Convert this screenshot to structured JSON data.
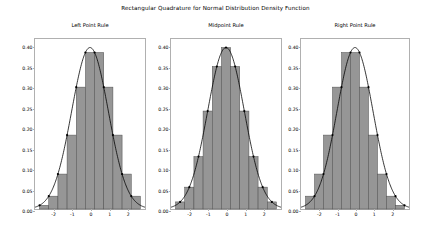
{
  "figure": {
    "suptitle": "Rectangular Quadrature for Normal Distribution Density Function",
    "width": 431,
    "height": 229,
    "background": "#ffffff"
  },
  "style": {
    "bar_fill": "#969696",
    "bar_edge": "#4d4d4d",
    "curve_color": "#000000",
    "marker_color": "#000000",
    "axes_edge": "#b0b0b0",
    "text_color": "#000000"
  },
  "chart_data": [
    {
      "type": "bar",
      "title": "Left Point Rule",
      "xlabel": "",
      "ylabel": "",
      "xlim": [
        -3.0,
        3.0
      ],
      "ylim": [
        0.0,
        0.42
      ],
      "grid": false,
      "legend": null,
      "xticks": [
        -2,
        -1,
        0,
        1,
        2
      ],
      "xticklabels": [
        "-2",
        "-1",
        "0",
        "1",
        "2"
      ],
      "yticks": [
        0.0,
        0.05,
        0.1,
        0.15,
        0.2,
        0.25,
        0.3,
        0.35,
        0.4
      ],
      "yticklabels": [
        "0.00",
        "0.05",
        "0.10",
        "0.15",
        "0.20",
        "0.25",
        "0.30",
        "0.35",
        "0.40"
      ],
      "bin_width": 0.5,
      "bin_left_edges": [
        -2.75,
        -2.25,
        -1.75,
        -1.25,
        -0.75,
        -0.25,
        0.25,
        0.75,
        1.25,
        1.75,
        2.25
      ],
      "sample_points": [
        -2.75,
        -2.25,
        -1.75,
        -1.25,
        -0.75,
        -0.25,
        0.25,
        0.75,
        1.25,
        1.75,
        2.25
      ],
      "values": [
        0.0091,
        0.0317,
        0.0863,
        0.1826,
        0.3011,
        0.3867,
        0.3867,
        0.3011,
        0.1826,
        0.0863,
        0.0317
      ],
      "curve": {
        "name": "Normal density",
        "mean": 0.0,
        "std": 1.0,
        "peak": 0.3989
      }
    },
    {
      "type": "bar",
      "title": "Midpoint Rule",
      "xlabel": "",
      "ylabel": "",
      "xlim": [
        -3.0,
        3.0
      ],
      "ylim": [
        0.0,
        0.42
      ],
      "grid": false,
      "legend": null,
      "xticks": [
        -2,
        -1,
        0,
        1,
        2
      ],
      "xticklabels": [
        "-2",
        "-1",
        "0",
        "1",
        "2"
      ],
      "yticks": [
        0.0,
        0.05,
        0.1,
        0.15,
        0.2,
        0.25,
        0.3,
        0.35,
        0.4
      ],
      "yticklabels": [
        "0.00",
        "0.05",
        "0.10",
        "0.15",
        "0.20",
        "0.25",
        "0.30",
        "0.35",
        "0.40"
      ],
      "bin_width": 0.5,
      "bin_left_edges": [
        -2.75,
        -2.25,
        -1.75,
        -1.25,
        -0.75,
        -0.25,
        0.25,
        0.75,
        1.25,
        1.75,
        2.25
      ],
      "sample_points": [
        -2.5,
        -2.0,
        -1.5,
        -1.0,
        -0.5,
        0.0,
        0.5,
        1.0,
        1.5,
        2.0,
        2.5
      ],
      "values": [
        0.0175,
        0.054,
        0.1295,
        0.242,
        0.3521,
        0.3989,
        0.3521,
        0.242,
        0.1295,
        0.054,
        0.0175
      ],
      "curve": {
        "name": "Normal density",
        "mean": 0.0,
        "std": 1.0,
        "peak": 0.3989
      }
    },
    {
      "type": "bar",
      "title": "Right Point Rule",
      "xlabel": "",
      "ylabel": "",
      "xlim": [
        -3.0,
        3.0
      ],
      "ylim": [
        0.0,
        0.42
      ],
      "grid": false,
      "legend": null,
      "xticks": [
        -2,
        -1,
        0,
        1,
        2
      ],
      "xticklabels": [
        "-2",
        "-1",
        "0",
        "1",
        "2"
      ],
      "yticks": [
        0.0,
        0.05,
        0.1,
        0.15,
        0.2,
        0.25,
        0.3,
        0.35,
        0.4
      ],
      "yticklabels": [
        "0.00",
        "0.05",
        "0.10",
        "0.15",
        "0.20",
        "0.25",
        "0.30",
        "0.35",
        "0.40"
      ],
      "bin_width": 0.5,
      "bin_left_edges": [
        -2.75,
        -2.25,
        -1.75,
        -1.25,
        -0.75,
        -0.25,
        0.25,
        0.75,
        1.25,
        1.75,
        2.25
      ],
      "sample_points": [
        -2.25,
        -1.75,
        -1.25,
        -0.75,
        -0.25,
        0.25,
        0.75,
        1.25,
        1.75,
        2.25,
        2.75
      ],
      "values": [
        0.0317,
        0.0863,
        0.1826,
        0.3011,
        0.3867,
        0.3867,
        0.3011,
        0.1826,
        0.0863,
        0.0317,
        0.0091
      ],
      "curve": {
        "name": "Normal density",
        "mean": 0.0,
        "std": 1.0,
        "peak": 0.3989
      }
    }
  ]
}
